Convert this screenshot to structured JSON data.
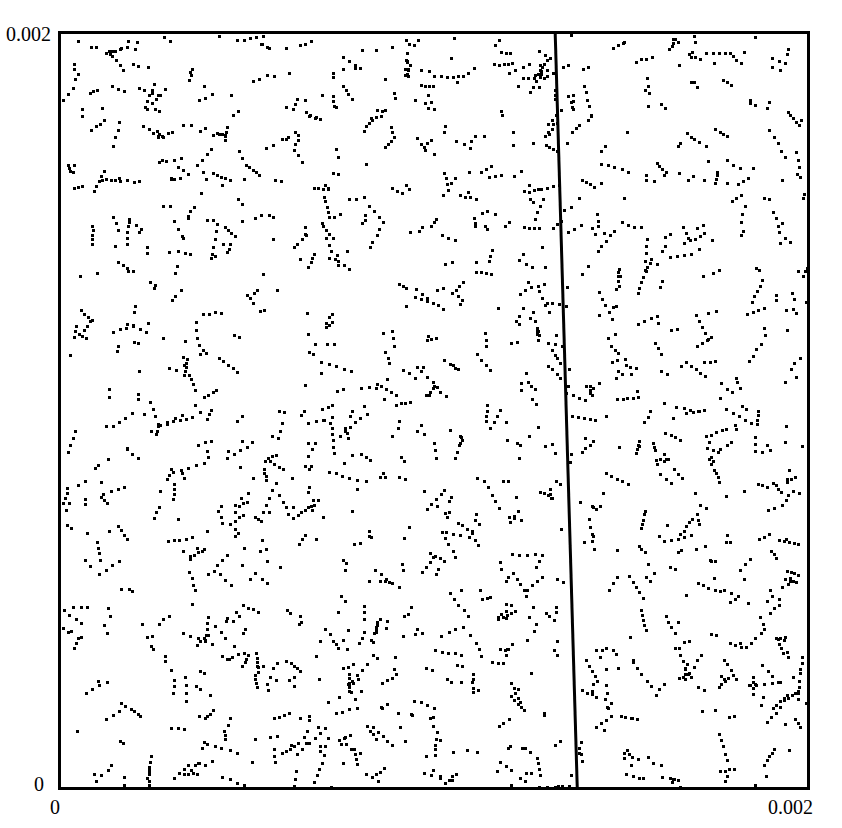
{
  "chart_data": {
    "type": "scatter",
    "title": "",
    "subtitle": "",
    "xlabel": "",
    "ylabel": "",
    "xlim": [
      0,
      0.002
    ],
    "ylim": [
      0,
      0.002
    ],
    "grid": false,
    "legend": null,
    "x_tick_labels": [
      "0",
      "0.002"
    ],
    "y_tick_labels": [
      "0",
      "0.002"
    ],
    "x_tick_values": [
      0,
      0.002
    ],
    "y_tick_values": [
      0,
      0.002
    ],
    "marker": {
      "shape": "square-dot",
      "color": "#000000",
      "size_px": 3
    },
    "n_points": 2500,
    "point_distribution": "pseudo-random uniform over [0,0.002]x[0,0.002] with visible lattice streak clustering",
    "annotations": [
      {
        "name": "vertical-boundary-line",
        "type": "line",
        "color": "#000000",
        "width_px": 3,
        "x_start_data": 0.001325,
        "y_start_data": 0.002,
        "x_end_data": 0.001384,
        "y_end_data": 0,
        "label": ""
      }
    ],
    "frame": {
      "visible": true,
      "color": "#000000",
      "width_px": 3
    }
  },
  "axes": {
    "y_max_label": "0.002",
    "y_min_label": "0",
    "x_min_label": "0",
    "x_max_label": "0.002"
  },
  "colors": {
    "background": "#ffffff",
    "foreground": "#000000",
    "point": "#000000",
    "line": "#000000"
  }
}
